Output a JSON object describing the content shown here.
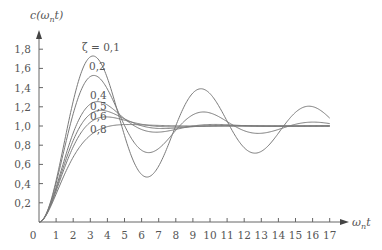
{
  "chart_data": {
    "type": "line",
    "title": "",
    "xlabel": "ωnt",
    "ylabel": "c(ωnt)",
    "xlim": [
      0,
      17
    ],
    "ylim": [
      0,
      1.9
    ],
    "grid": false,
    "legend": "inline labels near peaks",
    "x_ticks": [
      0,
      1,
      2,
      3,
      4,
      5,
      6,
      7,
      8,
      9,
      10,
      11,
      12,
      13,
      14,
      15,
      16,
      17
    ],
    "y_ticks": [
      0.2,
      0.4,
      0.6,
      0.8,
      1.0,
      1.2,
      1.4,
      1.6,
      1.8
    ],
    "x_tick_labels": [
      "0",
      "1",
      "2",
      "3",
      "4",
      "5",
      "6",
      "7",
      "8",
      "9",
      "10",
      "11",
      "12",
      "13",
      "14",
      "15",
      "16",
      "17"
    ],
    "y_tick_labels": [
      "0,2",
      "0,4",
      "0,6",
      "0,8",
      "1,0",
      "1,2",
      "1,4",
      "1,6",
      "1,8"
    ],
    "origin_label": "0",
    "series": [
      {
        "name": "ζ = 0,1",
        "zeta": 0.1,
        "label": "ζ = 0,1",
        "peak": 1.73,
        "peak_t": 3.16
      },
      {
        "name": "0,2",
        "zeta": 0.2,
        "label": "0,2",
        "peak": 1.53,
        "peak_t": 3.2
      },
      {
        "name": "0,4",
        "zeta": 0.4,
        "label": "0,4",
        "peak": 1.25,
        "peak_t": 3.43
      },
      {
        "name": "0,5",
        "zeta": 0.5,
        "label": "0,5",
        "peak": 1.16,
        "peak_t": 3.63
      },
      {
        "name": "0,6",
        "zeta": 0.6,
        "label": "0,6",
        "peak": 1.09,
        "peak_t": 3.93
      },
      {
        "name": "0,8",
        "zeta": 0.8,
        "label": "0,8",
        "peak": 1.015,
        "peak_t": 5.24
      }
    ],
    "formula": "c(t) = 1 - e^(-ζt)/sqrt(1-ζ²) · sin(sqrt(1-ζ²)·t + acos ζ)"
  },
  "style": {
    "curve_color": "#7a7a7a",
    "axis_color": "#666666"
  }
}
